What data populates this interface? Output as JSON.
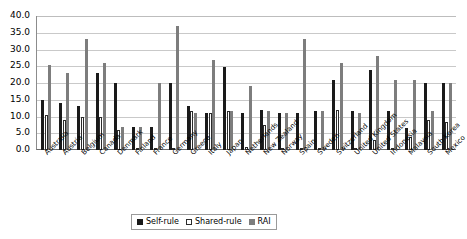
{
  "chart_data": {
    "type": "bar",
    "title": "",
    "subtitle": "",
    "xlabel": "",
    "ylabel": "",
    "ylim": [
      0,
      40
    ],
    "ytick_step": 5,
    "ytick_labels": [
      "0.0",
      "5.0",
      "10.0",
      "15.0",
      "20.0",
      "25.0",
      "30.0",
      "35.0",
      "40.0"
    ],
    "grid": true,
    "legend_position": "bottom-center",
    "categories": [
      "Australia",
      "Austria",
      "Belgium",
      "Canada",
      "Denmark",
      "Finland",
      "France",
      "Germany",
      "Greece",
      "Italy",
      "Japan",
      "Netherlands",
      "New Zealand",
      "Norway",
      "Spain",
      "Sweden",
      "Switzerland",
      "United Kingdom",
      "United States",
      "Indonesia",
      "Malaysia",
      "South Korea",
      "Mexico"
    ],
    "series": [
      {
        "name": "Self-rule",
        "color": "#1a1a1a",
        "values": [
          15.0,
          14.0,
          13.0,
          23.0,
          20.0,
          7.0,
          7.0,
          20.0,
          13.0,
          11.0,
          24.8,
          11.0,
          12.0,
          11.0,
          11.0,
          11.5,
          21.0,
          11.5,
          24.0,
          11.5,
          6.5,
          20.0,
          20.0
        ]
      },
      {
        "name": "Shared-rule",
        "color": "#ffffff",
        "values": [
          10.5,
          9.0,
          10.0,
          10.0,
          6.0,
          0.4,
          0.4,
          0.5,
          11.5,
          11.0,
          11.5,
          1.0,
          7.5,
          0.4,
          0.4,
          0.4,
          12.0,
          0.4,
          3.0,
          0.4,
          4.0,
          9.0,
          8.5
        ]
      },
      {
        "name": "RAI",
        "color": "#7d7d7d",
        "values": [
          25.5,
          23.0,
          33.0,
          26.0,
          7.0,
          7.0,
          20.0,
          37.0,
          11.0,
          27.0,
          11.5,
          19.0,
          11.5,
          11.0,
          33.0,
          11.5,
          26.0,
          11.0,
          28.0,
          21.0,
          21.0,
          11.5,
          20.0
        ]
      }
    ]
  },
  "legend": {
    "items": [
      {
        "label": "Self-rule"
      },
      {
        "label": "Shared-rule"
      },
      {
        "label": "RAI"
      }
    ]
  }
}
